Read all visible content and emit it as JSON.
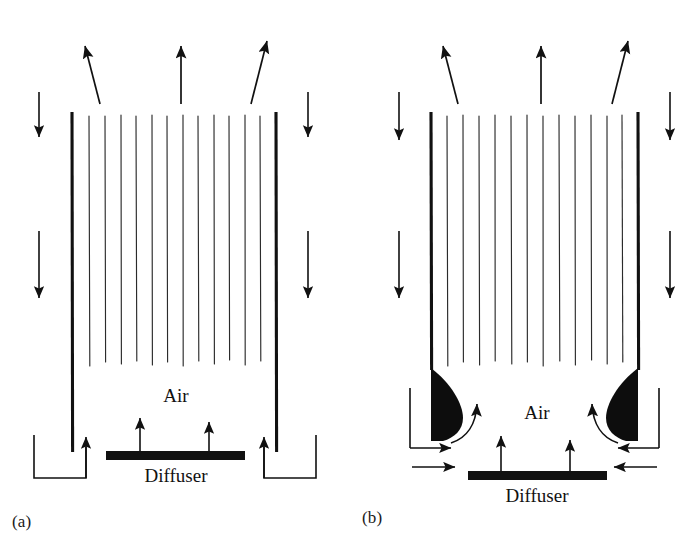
{
  "figure": {
    "type": "diagram",
    "background_color": "#ffffff",
    "ink_color": "#111111",
    "panel_count": 2
  },
  "panels": [
    {
      "id": "a",
      "caption": "(a)",
      "labels": {
        "air": "Air",
        "diffuser": "Diffuser"
      },
      "description": "Bubble column with straight draft tube walls, uniform bubble curtain, no recirculation vortices",
      "geometry": {
        "wall_left_x": 72,
        "wall_right_x": 276,
        "wall_top_y": 112,
        "wall_bottom_y": 452,
        "bubble_line_count": 13,
        "bubble_line_top_y": 115,
        "bubble_line_bottom_y": 368,
        "diffuser_x1": 106,
        "diffuser_x2": 245,
        "diffuser_y": 455,
        "diffuser_thickness": 9,
        "channel_left_outer_x": 34,
        "channel_right_outer_x": 316,
        "channel_bottom_y": 478
      },
      "arrows": {
        "top_exit": [
          {
            "name": "exit-arrow-left",
            "tilt": "left"
          },
          {
            "name": "exit-arrow-center",
            "tilt": "vertical"
          },
          {
            "name": "exit-arrow-right",
            "tilt": "right"
          }
        ],
        "downflow_left_count": 2,
        "downflow_right_count": 2,
        "riser_return_left": 1,
        "riser_return_right": 1,
        "diffuser_feed_count": 2
      }
    },
    {
      "id": "b",
      "caption": "(b)",
      "labels": {
        "air": "Air",
        "diffuser": "Diffuser"
      },
      "description": "Bubble column with stagnant dead zones (solid black wedges) at the base of each wall and recirculation eddies",
      "geometry": {
        "wall_left_x": 81,
        "wall_right_x": 288,
        "wall_top_y": 112,
        "wall_bottom_y": 368,
        "bubble_line_count": 13,
        "bubble_line_top_y": 115,
        "bubble_line_bottom_y": 368,
        "diffuser_x1": 118,
        "diffuser_x2": 257,
        "diffuser_y": 475,
        "diffuser_thickness": 9,
        "wedge_top_y": 368,
        "wedge_bottom_y": 440,
        "wedge_width": 33
      },
      "arrows": {
        "top_exit": [
          {
            "name": "exit-arrow-left",
            "tilt": "left"
          },
          {
            "name": "exit-arrow-center",
            "tilt": "vertical"
          },
          {
            "name": "exit-arrow-right",
            "tilt": "right"
          }
        ],
        "downflow_left_count": 2,
        "downflow_right_count": 2,
        "eddy_curve_left": 1,
        "eddy_curve_right": 1,
        "inflow_left_count": 2,
        "inflow_right_count": 2,
        "diffuser_feed_count": 2
      }
    }
  ]
}
